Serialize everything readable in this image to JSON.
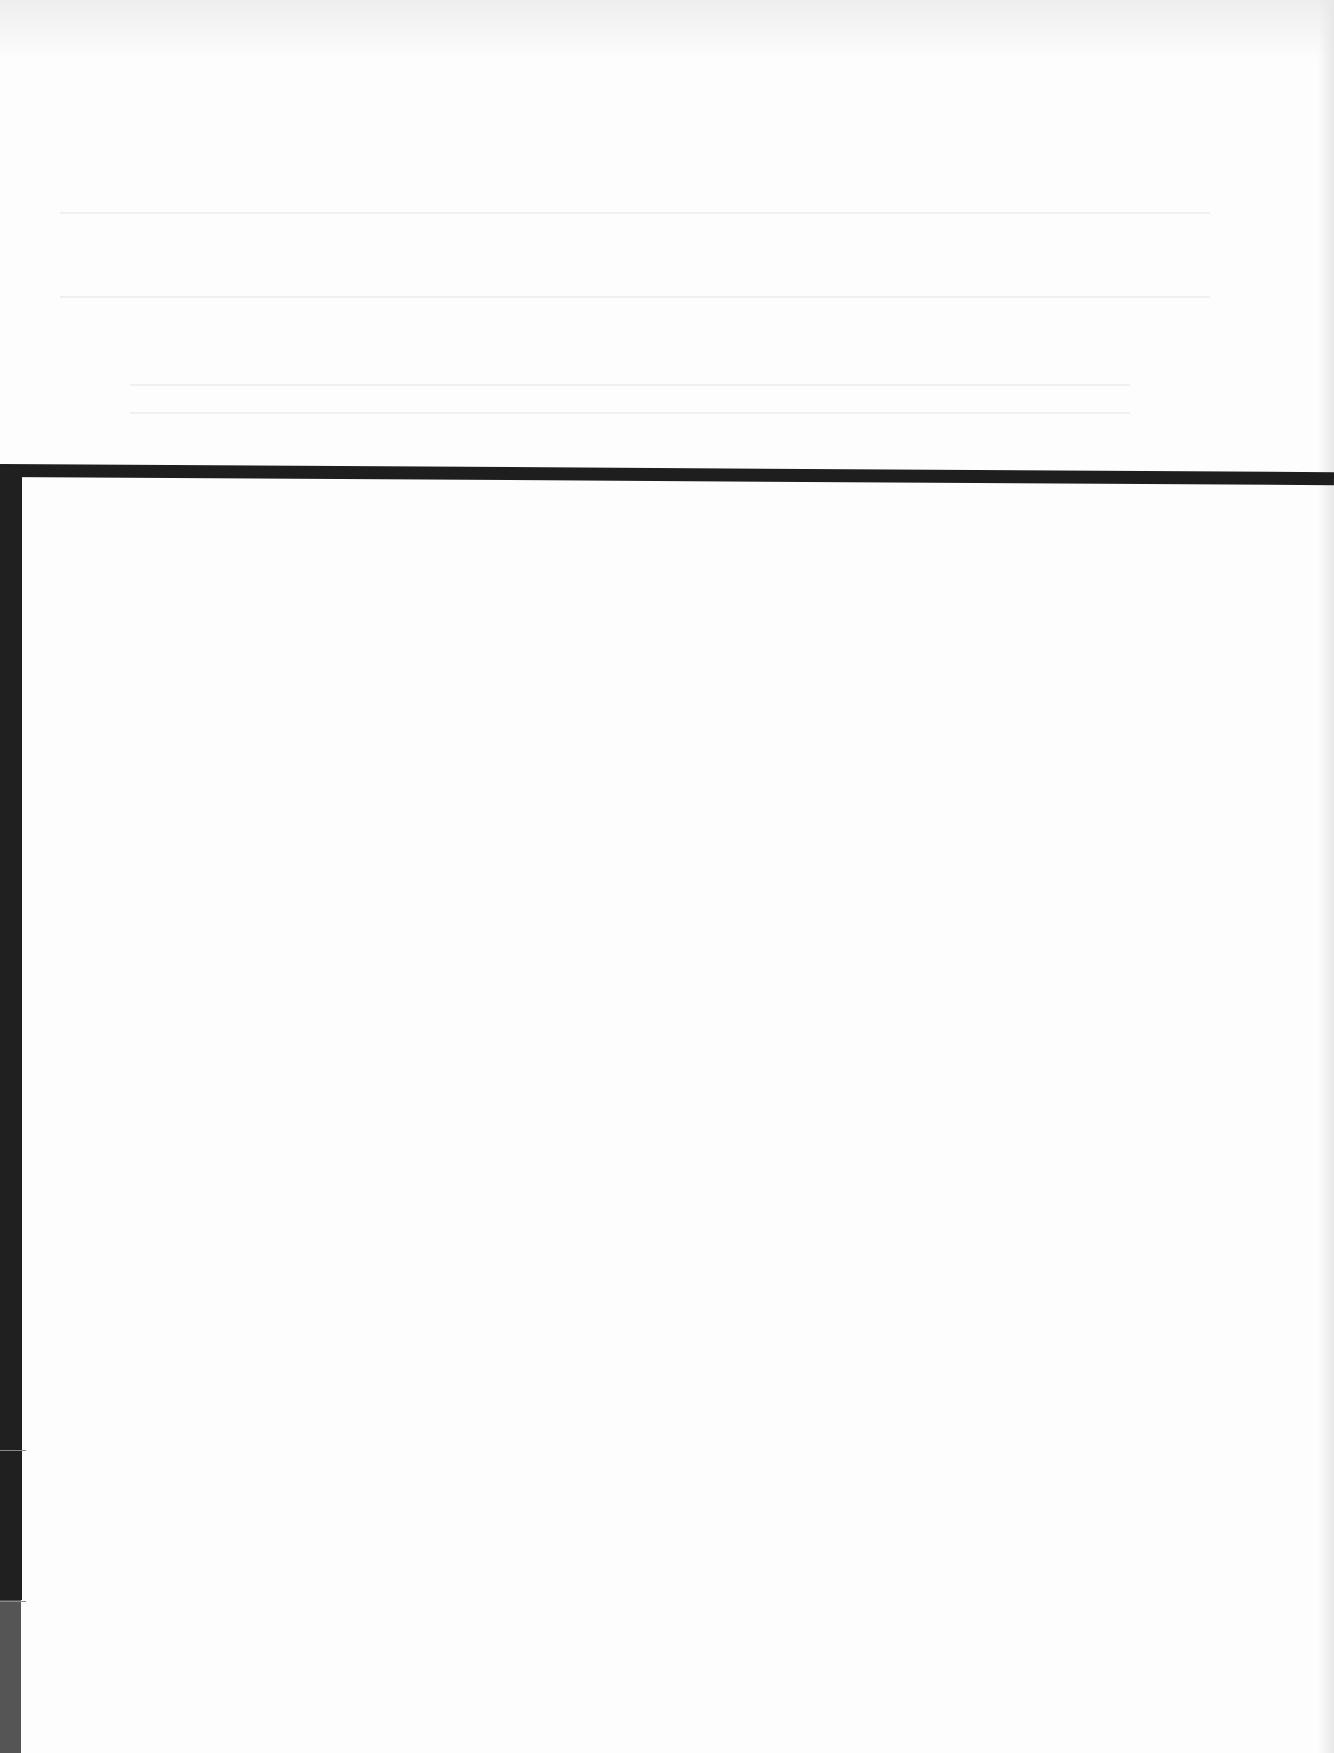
{
  "document": {
    "type": "scanned-page",
    "visible_text": "",
    "note_legible_content": "",
    "colors": {
      "paper": "#fdfdfd",
      "rule": "#1e1e1e",
      "left_bar_dark": "#202020",
      "left_bar_grey": "#555555"
    }
  }
}
